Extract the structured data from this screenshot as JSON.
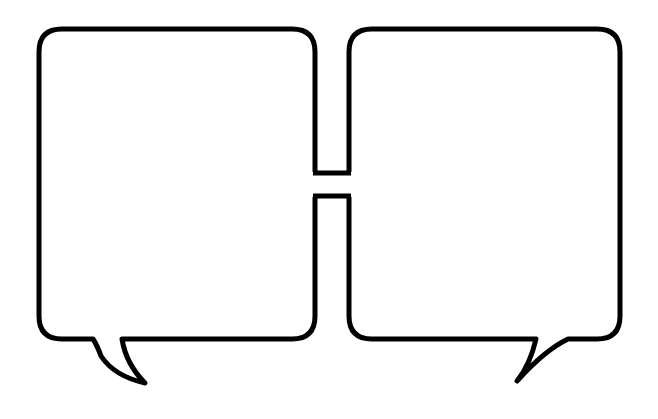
{
  "graphic": {
    "description": "Two joined blank speech bubbles",
    "stroke_color": "#000000",
    "fill_color": "#ffffff",
    "background": "#ffffff",
    "bubbles": [
      {
        "id": "left",
        "text": "",
        "tail": "bottom-left, curving right"
      },
      {
        "id": "right",
        "text": "",
        "tail": "bottom-right, curving left"
      }
    ]
  }
}
